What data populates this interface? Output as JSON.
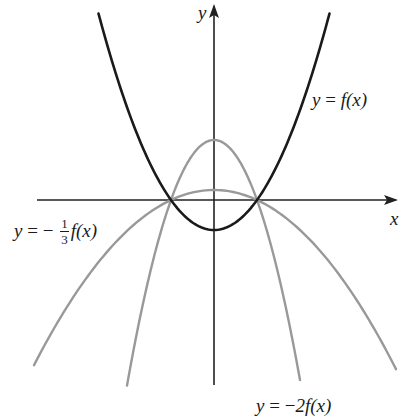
{
  "figure": {
    "axes": {
      "x_label": "x",
      "y_label": "y",
      "origin_px": [
        214,
        200
      ],
      "x_axis_px": [
        37,
        396
      ],
      "y_axis_px": [
        385,
        6
      ]
    },
    "colors": {
      "axis": "#222222",
      "f_curve": "#1a1a1a",
      "transformed_curves": "#999999",
      "text": "#1a1a1a"
    },
    "labels": {
      "f": {
        "lhs": "y",
        "eq": " = ",
        "rhs": "f(x)"
      },
      "neg_third": {
        "lhs": "y",
        "eq": " = − ",
        "num": "1",
        "den": "3",
        "rhs": "f(x)"
      },
      "neg_two": {
        "lhs": "y",
        "eq": " = −",
        "rhs": "2f(x)"
      }
    }
  },
  "chart_data": {
    "type": "line",
    "title": "",
    "xlabel": "x",
    "ylabel": "y",
    "grid": false,
    "note": "Pixel-space model: f(x) = a(x^2 - r^2) with root r = 43px, f(0) = -30px; transformed curves share the same roots.",
    "series": [
      {
        "name": "y = f(x)",
        "color": "#1a1a1a",
        "stroke_width": 2.6,
        "scale": 1,
        "x_range_px": [
          -115.5,
          115.5
        ],
        "vertex_px": [
          0,
          -30
        ],
        "roots_px": [
          -43,
          43
        ]
      },
      {
        "name": "y = -2f(x)",
        "color": "#999999",
        "stroke_width": 2.4,
        "scale": -2,
        "x_range_px": [
          -87,
          86
        ],
        "vertex_px": [
          0,
          60
        ],
        "roots_px": [
          -43,
          43
        ]
      },
      {
        "name": "y = -1/3 f(x)",
        "color": "#999999",
        "stroke_width": 2.4,
        "scale": -0.3333,
        "x_range_px": [
          -180,
          182
        ],
        "vertex_px": [
          0,
          10
        ],
        "roots_px": [
          -43,
          43
        ]
      }
    ],
    "root_px": 43,
    "f_vertex_depth_px": 30
  }
}
